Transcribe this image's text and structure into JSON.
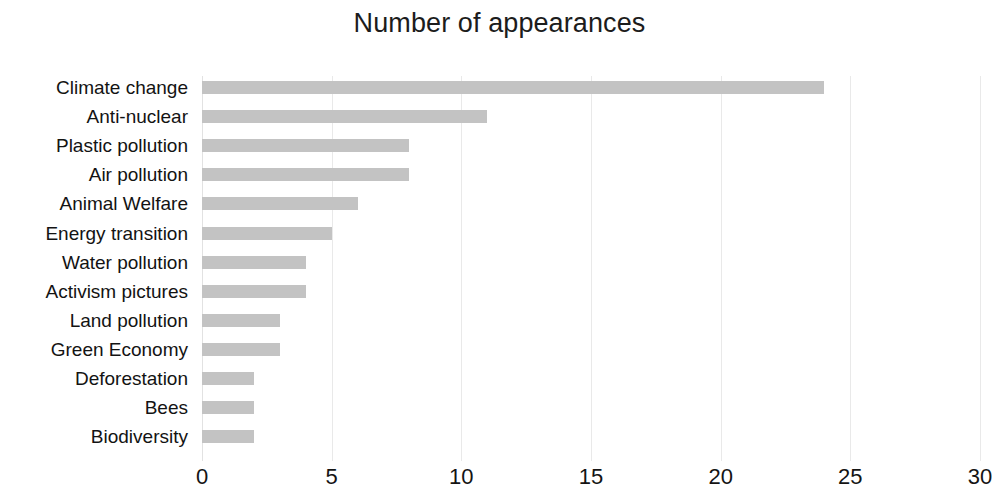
{
  "chart_data": {
    "type": "bar",
    "orientation": "horizontal",
    "title": "Number of appearances",
    "xlabel": "",
    "ylabel": "",
    "categories": [
      "Climate change",
      "Anti-nuclear",
      "Plastic pollution",
      "Air pollution",
      "Animal Welfare",
      "Energy transition",
      "Water pollution",
      "Activism pictures",
      "Land pollution",
      "Green Economy",
      "Deforestation",
      "Bees",
      "Biodiversity"
    ],
    "values": [
      24,
      11,
      8,
      8,
      6,
      5,
      4,
      4,
      3,
      3,
      2,
      2,
      2
    ],
    "xlim": [
      0,
      30
    ],
    "xticks": [
      0,
      5,
      10,
      15,
      20,
      25,
      30
    ],
    "xtick_labels": [
      "0",
      "5",
      "10",
      "15",
      "20",
      "25",
      "30"
    ],
    "grid": true,
    "grid_axis": "x",
    "legend": false,
    "bar_color": "#c3c3c3",
    "background_color": "#ffffff",
    "text_color": "#131313",
    "gridline_color": "#e9e9e9"
  }
}
